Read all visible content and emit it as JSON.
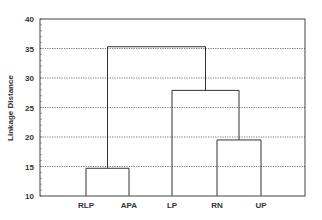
{
  "chart_data": {
    "type": "dendrogram",
    "title": "",
    "xlabel": "",
    "ylabel": "Linkage Distance",
    "ylim": [
      10,
      40
    ],
    "yticks": [
      10,
      15,
      20,
      25,
      30,
      35,
      40
    ],
    "grid": {
      "horizontal": true,
      "style": "dotted"
    },
    "leaves": [
      "RLP",
      "APA",
      "LP",
      "RN",
      "UP"
    ],
    "merges": [
      {
        "left": "RLP",
        "right": "APA",
        "height": 14.7
      },
      {
        "left": "RN",
        "right": "UP",
        "height": 19.5
      },
      {
        "left": "LP",
        "right": "RN+UP",
        "height": 27.9
      },
      {
        "left": "RLP+APA",
        "right": "LP+RN+UP",
        "height": 35.3
      }
    ],
    "colors": {
      "line": "#333333",
      "grid": "#555555",
      "axis": "#333333"
    }
  }
}
